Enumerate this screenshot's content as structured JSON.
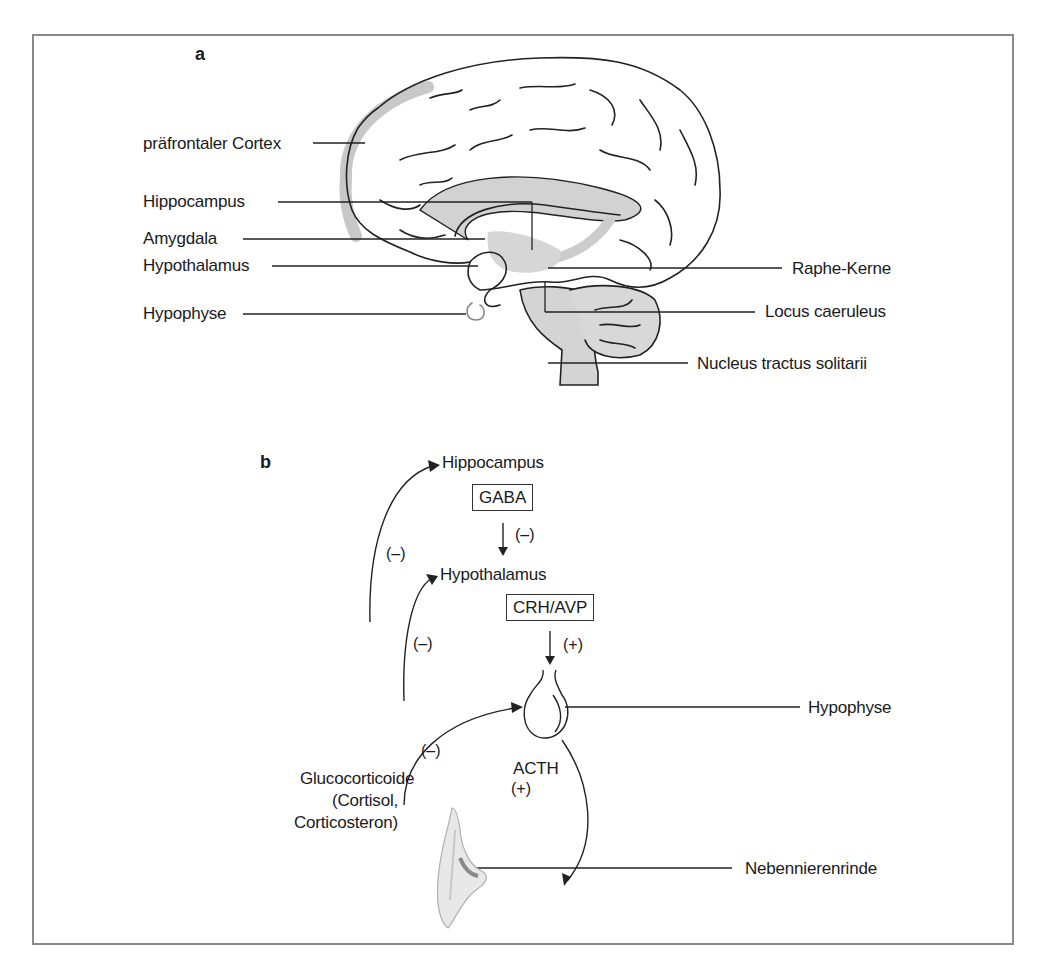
{
  "figure": {
    "colors": {
      "frame": "#8a8a8a",
      "line": "#222222",
      "highlight_gray": "#c8c8c8",
      "background": "#ffffff"
    },
    "panel_a": {
      "letter": "a",
      "title_icon": "brain-sagittal-section-icon",
      "labels_left": [
        {
          "id": "praefrontaler-cortex",
          "text": "präfrontaler Cortex"
        },
        {
          "id": "hippocampus",
          "text": "Hippocampus"
        },
        {
          "id": "amygdala",
          "text": "Amygdala"
        },
        {
          "id": "hypothalamus",
          "text": "Hypothalamus"
        },
        {
          "id": "hypophyse",
          "text": "Hypophyse"
        }
      ],
      "labels_right": [
        {
          "id": "raphe-kerne",
          "text": "Raphe-Kerne"
        },
        {
          "id": "locus-caeruleus",
          "text": "Locus caeruleus"
        },
        {
          "id": "nucleus-tractus-solitarii",
          "text": "Nucleus tractus solitarii"
        }
      ]
    },
    "panel_b": {
      "letter": "b",
      "nodes": {
        "hippocampus": "Hippocampus",
        "hypothalamus": "Hypothalamus",
        "hypophyse": "Hypophyse",
        "nebennierenrinde": "Nebennierenrinde"
      },
      "boxes": {
        "gaba": "GABA",
        "crh_avp": "CRH/AVP"
      },
      "signs": {
        "gaba_effect": "(–)",
        "crh_effect": "(+)",
        "feedback_hippocampus": "(–)",
        "feedback_hypothalamus": "(–)",
        "feedback_hypophyse": "(–)",
        "acth_effect": "(+)"
      },
      "hormones": {
        "acth": "ACTH",
        "glucocorticoide_line1": "Glucocorticoide",
        "glucocorticoide_line2": "(Cortisol,",
        "glucocorticoide_line3": "Corticosteron)"
      }
    }
  }
}
